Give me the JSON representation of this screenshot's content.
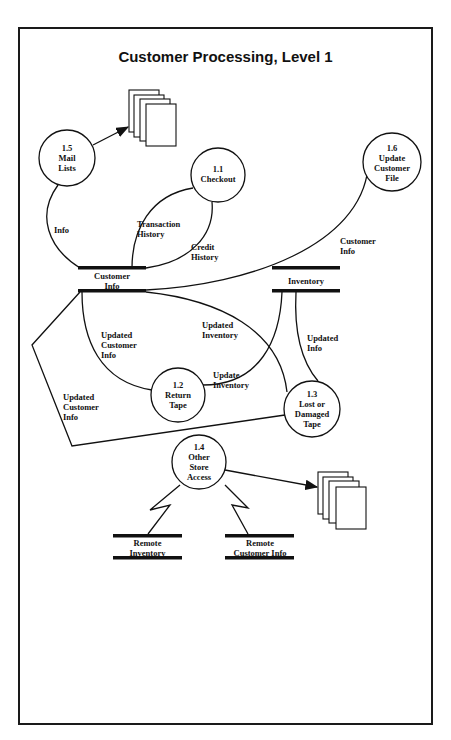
{
  "diagram": {
    "title": "Customer Processing, Level 1",
    "type": "data-flow-diagram",
    "processes": [
      {
        "id": "1.5",
        "name": "Mail\nLists",
        "label": "1.5\nMail\nLists"
      },
      {
        "id": "1.1",
        "name": "Checkout",
        "label": "1.1\nCheckout"
      },
      {
        "id": "1.6",
        "name": "Update\nCustomer\nFile",
        "label": "1.6\nUpdate\nCustomer\nFile"
      },
      {
        "id": "1.2",
        "name": "Return\nTape",
        "label": "1.2\nReturn\nTape"
      },
      {
        "id": "1.3",
        "name": "Lost or\nDamaged\nTape",
        "label": "1.3\nLost or\nDamaged\nTape"
      },
      {
        "id": "1.4",
        "name": "Other\nStore\nAccess",
        "label": "1.4\nOther\nStore\nAccess"
      }
    ],
    "data_stores": [
      {
        "name": "Customer\nInfo"
      },
      {
        "name": "Inventory"
      },
      {
        "name": "Remote\nInventory"
      },
      {
        "name": "Remote\nCustomer Info"
      }
    ],
    "flows": [
      {
        "label": "Info",
        "from": "Customer Info",
        "to": "1.5"
      },
      {
        "label": "Transaction\nHistory",
        "from": "1.1",
        "to": "Customer Info"
      },
      {
        "label": "Credit\nHistory",
        "from": "Customer Info",
        "to": "1.1"
      },
      {
        "label": "Customer\nInfo",
        "from": "1.6",
        "to": "Customer Info"
      },
      {
        "label": "Updated\nCustomer\nInfo",
        "from": "1.2",
        "to": "Customer Info"
      },
      {
        "label": "Updated\nInventory",
        "from": "1.3",
        "to": "Customer Info"
      },
      {
        "label": "Update\nInventory",
        "from": "1.2",
        "to": "Inventory"
      },
      {
        "label": "Updated\nInfo",
        "from": "Inventory",
        "to": "1.3"
      },
      {
        "label": "Updated\nCustomer\nInfo",
        "from": "1.3",
        "to": "Customer Info"
      },
      {
        "label": "",
        "from": "1.5",
        "to": "Documents (top)"
      },
      {
        "label": "",
        "from": "1.4",
        "to": "Documents (bottom)"
      },
      {
        "label": "",
        "from": "1.4",
        "to": "Remote Inventory"
      },
      {
        "label": "",
        "from": "1.4",
        "to": "Remote Customer Info"
      }
    ]
  }
}
